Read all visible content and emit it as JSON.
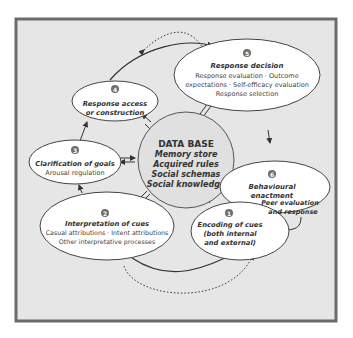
{
  "diagram": {
    "colors": {
      "frame_border": "#6b6b6b",
      "panel_bg": "#e6e6e6",
      "node_fill": "#ffffff",
      "database_fill": "#e0e0e0",
      "badge_fill": "#6d6d6d",
      "text": "#333333"
    },
    "database": {
      "title": "DATA BASE",
      "items": [
        "Memory store",
        "Acquired rules",
        "Social schemas",
        "Social knowledge"
      ]
    },
    "nodes": [
      {
        "number": "1",
        "title_lines": [
          "Encoding of cues",
          "(both internal",
          "and external)"
        ],
        "detail_lines": []
      },
      {
        "number": "2",
        "title_lines": [
          "Interpretation of cues"
        ],
        "detail_lines": [
          "Casual attributions · Intent attributions",
          "Other interpretative processes"
        ]
      },
      {
        "number": "3",
        "title_lines": [
          "Clarification of goals"
        ],
        "detail_lines": [
          "Arousal regulation"
        ]
      },
      {
        "number": "4",
        "title_lines": [
          "Response access",
          "or construction"
        ],
        "detail_lines": []
      },
      {
        "number": "5",
        "title_lines": [
          "Response decision"
        ],
        "detail_lines": [
          "Response evaluation · Outcome",
          "expectations · Self-efficacy evaluation",
          "Response selection"
        ]
      },
      {
        "number": "6",
        "title_lines": [
          "Behavioural",
          "enactment"
        ],
        "detail_lines": []
      }
    ],
    "feedback_label": [
      "Peer evaluation",
      "and response"
    ]
  }
}
